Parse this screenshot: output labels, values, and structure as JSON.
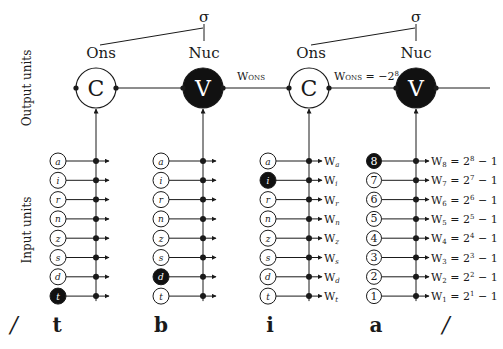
{
  "axis_labels": {
    "output": "Output units",
    "input": "Input units"
  },
  "syllables": [
    {
      "root": "σ",
      "onset": "Ons",
      "nucleus": "Nuc"
    },
    {
      "root": "σ",
      "onset": "Ons",
      "nucleus": "Nuc"
    }
  ],
  "output_units": [
    {
      "label": "C",
      "type": "consonant",
      "active": false
    },
    {
      "label": "V",
      "type": "vowel",
      "active": true
    },
    {
      "label": "C",
      "type": "consonant",
      "active": false
    },
    {
      "label": "V",
      "type": "vowel",
      "active": true
    }
  ],
  "connection_labels": {
    "v_to_c": "W",
    "v_to_c_sub": "ONS",
    "c_to_v": "W",
    "c_to_v_sub": "ONS",
    "c_to_v_value": " = −2",
    "c_to_v_exp": "8"
  },
  "input_columns": [
    {
      "segment": "t",
      "kind": "consonant",
      "features": [
        {
          "label": "a",
          "active": false
        },
        {
          "label": "i",
          "active": false
        },
        {
          "label": "r",
          "active": false
        },
        {
          "label": "n",
          "active": false
        },
        {
          "label": "z",
          "active": false
        },
        {
          "label": "s",
          "active": false
        },
        {
          "label": "d",
          "active": false
        },
        {
          "label": "t",
          "active": true
        }
      ]
    },
    {
      "segment": "b",
      "kind": "consonant",
      "features": [
        {
          "label": "a",
          "active": false
        },
        {
          "label": "i",
          "active": false
        },
        {
          "label": "r",
          "active": false
        },
        {
          "label": "n",
          "active": false
        },
        {
          "label": "z",
          "active": false
        },
        {
          "label": "s",
          "active": false
        },
        {
          "label": "d",
          "active": true
        },
        {
          "label": "t",
          "active": false
        }
      ]
    },
    {
      "segment": "i",
      "kind": "consonant",
      "features": [
        {
          "label": "a",
          "active": false,
          "weight": "W",
          "weight_sub": "a"
        },
        {
          "label": "i",
          "active": true,
          "weight": "W",
          "weight_sub": "i"
        },
        {
          "label": "r",
          "active": false,
          "weight": "W",
          "weight_sub": "r"
        },
        {
          "label": "n",
          "active": false,
          "weight": "W",
          "weight_sub": "n"
        },
        {
          "label": "z",
          "active": false,
          "weight": "W",
          "weight_sub": "z"
        },
        {
          "label": "s",
          "active": false,
          "weight": "W",
          "weight_sub": "s"
        },
        {
          "label": "d",
          "active": false,
          "weight": "W",
          "weight_sub": "d"
        },
        {
          "label": "t",
          "active": false,
          "weight": "W",
          "weight_sub": "t"
        }
      ]
    },
    {
      "segment": "a",
      "kind": "vowel",
      "features": [
        {
          "label": "8",
          "active": true,
          "weight": "W",
          "weight_sub": "8",
          "formula": " = 2",
          "exp": "8",
          "tail": " − 1"
        },
        {
          "label": "7",
          "active": false,
          "weight": "W",
          "weight_sub": "7",
          "formula": " = 2",
          "exp": "7",
          "tail": " − 1"
        },
        {
          "label": "6",
          "active": false,
          "weight": "W",
          "weight_sub": "6",
          "formula": " = 2",
          "exp": "6",
          "tail": " − 1"
        },
        {
          "label": "5",
          "active": false,
          "weight": "W",
          "weight_sub": "5",
          "formula": " = 2",
          "exp": "5",
          "tail": " − 1"
        },
        {
          "label": "4",
          "active": false,
          "weight": "W",
          "weight_sub": "4",
          "formula": " = 2",
          "exp": "4",
          "tail": " − 1"
        },
        {
          "label": "3",
          "active": false,
          "weight": "W",
          "weight_sub": "3",
          "formula": " = 2",
          "exp": "3",
          "tail": " − 1"
        },
        {
          "label": "2",
          "active": false,
          "weight": "W",
          "weight_sub": "2",
          "formula": " = 2",
          "exp": "2",
          "tail": " − 1"
        },
        {
          "label": "1",
          "active": false,
          "weight": "W",
          "weight_sub": "1",
          "formula": " = 2",
          "exp": "1",
          "tail": " − 1"
        }
      ]
    }
  ],
  "boundaries": {
    "left": "/",
    "right": "/"
  },
  "colors": {
    "ink": "#1a1a1a",
    "active_fill": "#111111",
    "inactive_fill": "#ffffff"
  }
}
